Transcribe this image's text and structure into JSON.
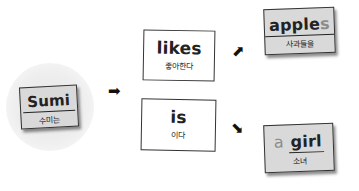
{
  "subject": {
    "word": "Sumi",
    "meaning": "수미는"
  },
  "verbs": [
    {
      "word": "likes",
      "meaning": "좋아한다"
    },
    {
      "word": "is",
      "meaning": "이다"
    }
  ],
  "objects": [
    {
      "main": "apple",
      "suffix": "s",
      "meaning": "사과들을"
    },
    {
      "prefix": "a",
      "main": "girl",
      "meaning": "소녀"
    }
  ],
  "arrows": {
    "right": "➡",
    "up_right": "⬈",
    "down_right": "⬊"
  }
}
